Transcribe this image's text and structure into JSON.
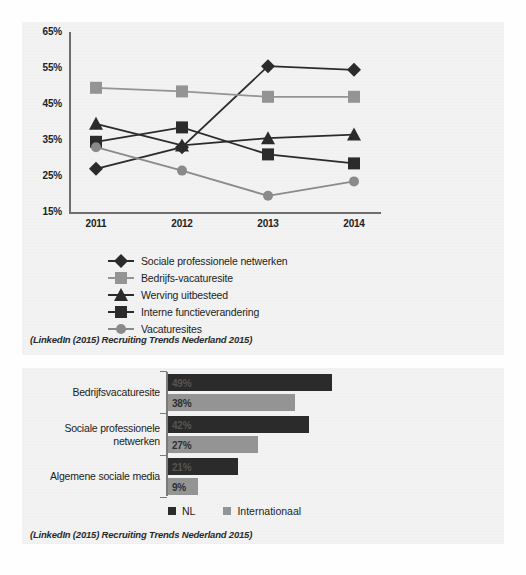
{
  "captions": {
    "line_source": "(LinkedIn (2015) Recruiting Trends Nederland 2015)",
    "bar_source": "(LinkedIn (2015) Recruiting Trends Nederland 2015)"
  },
  "colors": {
    "dark": "#2b2b2b",
    "gray": "#949494",
    "axis": "#6e6e6e",
    "panel": "#f2f2f2"
  },
  "chart_data": [
    {
      "type": "line",
      "title": "",
      "xlabel": "",
      "ylabel": "",
      "x": [
        "2011",
        "2012",
        "2013",
        "2014"
      ],
      "ytick_labels": [
        "65%",
        "55%",
        "45%",
        "35%",
        "25%",
        "15%"
      ],
      "ylim": [
        15,
        65
      ],
      "grid": false,
      "legend_position": "below",
      "series": [
        {
          "name": "Sociale professionele netwerken",
          "marker": "diamond",
          "color": "#2b2b2b",
          "values": [
            27,
            33,
            55.5,
            54.5
          ]
        },
        {
          "name": "Bedrijfs-vacaturesite",
          "marker": "square",
          "color": "#949494",
          "values": [
            49.5,
            48.5,
            47,
            47
          ]
        },
        {
          "name": "Werving uitbesteed",
          "marker": "triangle",
          "color": "#2b2b2b",
          "values": [
            39.5,
            33.5,
            35.5,
            36.5
          ]
        },
        {
          "name": "Interne functieverandering",
          "marker": "square",
          "color": "#2b2b2b",
          "values": [
            34.5,
            38.5,
            31,
            28.5
          ]
        },
        {
          "name": "Vacaturesites",
          "marker": "circle",
          "color": "#8a8a8a",
          "values": [
            33,
            26.5,
            19.5,
            23.5
          ]
        }
      ]
    },
    {
      "type": "bar",
      "orientation": "horizontal",
      "title": "",
      "xlabel": "",
      "ylabel": "",
      "categories": [
        "Bedrijfsvacaturesite",
        "Sociale professionele netwerken",
        "Algemene sociale media"
      ],
      "grid": false,
      "legend_position": "below",
      "series": [
        {
          "name": "NL",
          "color": "#2b2b2b",
          "values": [
            49,
            42,
            21
          ],
          "labels": [
            "49%",
            "42%",
            "21%"
          ]
        },
        {
          "name": "Internationaal",
          "color": "#949494",
          "values": [
            38,
            27,
            9
          ],
          "labels": [
            "38%",
            "27%",
            "9%"
          ]
        }
      ]
    }
  ]
}
